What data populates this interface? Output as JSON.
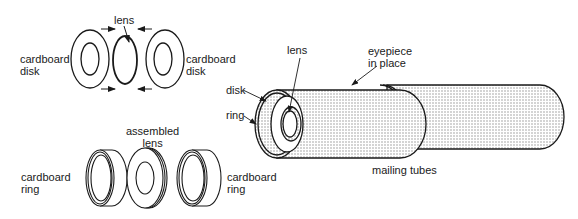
{
  "diagram": {
    "type": "telescope-eyepiece-assembly",
    "colors": {
      "ink": "#1a1a1a",
      "stipple": "#9a9a9a",
      "background": "#ffffff"
    },
    "labels": {
      "cardboard_disk_left": [
        "cardboard",
        "disk"
      ],
      "lens_top": "lens",
      "cardboard_disk_right": [
        "cardboard",
        "disk"
      ],
      "assembled_lens": [
        "assembled",
        "lens"
      ],
      "cardboard_ring_left": [
        "cardboard",
        "ring"
      ],
      "cardboard_ring_right": [
        "cardboard",
        "ring"
      ],
      "lens_tube": "lens",
      "eyepiece_in_place": [
        "eyepiece",
        "in place"
      ],
      "disk": "disk",
      "ring": "ring",
      "mailing_tubes": "mailing tubes"
    },
    "groups": [
      {
        "name": "exploded-lens-assembly",
        "parts": [
          "cardboard disk",
          "lens",
          "cardboard disk"
        ]
      },
      {
        "name": "ring-assembly",
        "parts": [
          "cardboard ring",
          "assembled lens",
          "cardboard ring"
        ]
      },
      {
        "name": "tube-assembly",
        "parts": [
          "disk",
          "ring",
          "lens",
          "eyepiece in place",
          "mailing tubes"
        ]
      }
    ]
  }
}
